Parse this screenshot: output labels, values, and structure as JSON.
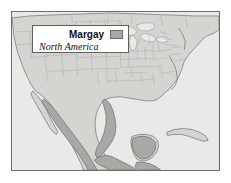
{
  "figure": {
    "kind": "range-map",
    "width": 231,
    "height": 183,
    "background_color": "#ffffff"
  },
  "legend": {
    "title": "Margay",
    "subtitle": "North America",
    "swatch_label": "range",
    "swatch_color": "#a8a8a4",
    "swatch_border_color": "#6b6b6b",
    "box_background": "#ffffff",
    "box_border_color": "#5f5f5f"
  },
  "map": {
    "frame_border_color": "#6e6e6e",
    "water_color": "#e9e9e7",
    "land_color": "#d4d4d0",
    "range_color": "#a8a8a4",
    "coastline_color": "#6f6f6f",
    "state_border_color": "#b4b4b0",
    "range_outline_color": "#6b6b6b",
    "regions": [
      {
        "name": "united-states",
        "label": "United States"
      },
      {
        "name": "canada",
        "label": "Canada"
      },
      {
        "name": "mexico",
        "label": "Mexico"
      },
      {
        "name": "central-america",
        "label": "Central America"
      },
      {
        "name": "cuba",
        "label": "Cuba"
      },
      {
        "name": "baja-california",
        "label": "Baja California"
      },
      {
        "name": "great-lakes",
        "label": "Great Lakes"
      },
      {
        "name": "gulf-of-mexico",
        "label": "Gulf of Mexico"
      },
      {
        "name": "yucatan-peninsula",
        "label": "Yucatan Peninsula"
      }
    ],
    "range_areas": [
      {
        "name": "sierra-madre-occidental",
        "label": "Sierra Madre Occidental"
      },
      {
        "name": "sierra-madre-oriental",
        "label": "Sierra Madre Oriental"
      },
      {
        "name": "southern-mexico",
        "label": "Southern Mexico"
      },
      {
        "name": "yucatan",
        "label": "Yucatan"
      },
      {
        "name": "central-america-range",
        "label": "Central America"
      }
    ]
  }
}
